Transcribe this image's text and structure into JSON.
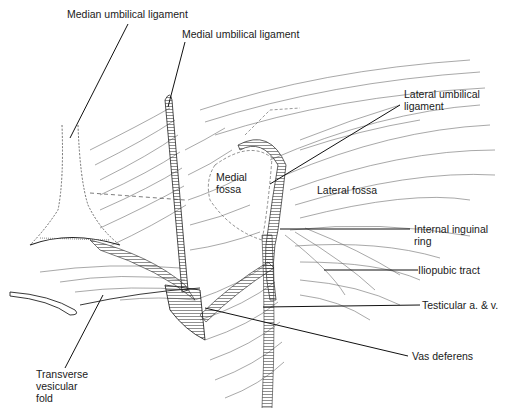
{
  "figure": {
    "type": "anatomical line drawing",
    "colors": {
      "ink": "#1a1a1a",
      "hatch": "#3a3a3a",
      "background": "#ffffff"
    }
  },
  "labels": {
    "median_umbilical_ligament": "Median umbilical ligament",
    "medial_umbilical_ligament": "Medial umbilical ligament",
    "lateral_umbilical_ligament": "Lateral umbilical\nligament",
    "medial_fossa": "Medial\nfossa",
    "lateral_fossa": "Lateral fossa",
    "internal_inguinal_ring": "Internal inguinal\nring",
    "iliopubic_tract": "Iliopubic tract",
    "testicular_vessels": "Testicular a. & v.",
    "vas_deferens": "Vas deferens",
    "transverse_vesicular_fold": "Transverse\nvesicular\nfold"
  }
}
